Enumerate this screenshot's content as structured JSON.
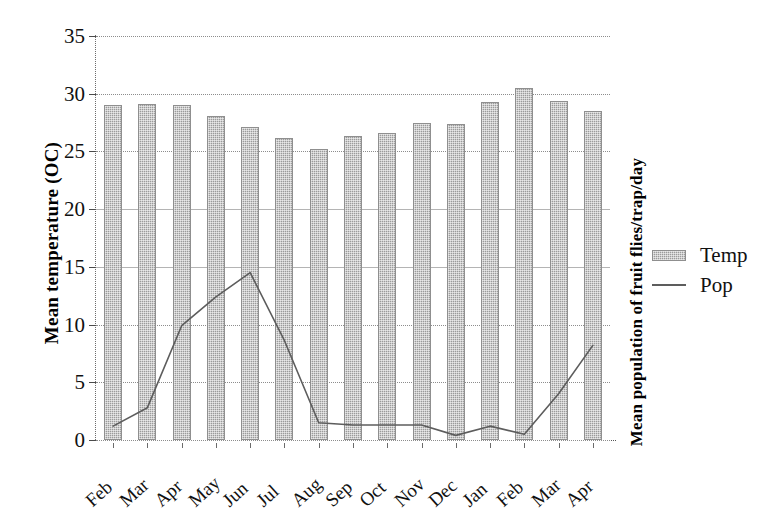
{
  "chart_data": {
    "type": "bar",
    "title": "",
    "xlabel": "",
    "ylabel": "Mean temperature (OC)",
    "y2label": "Mean population of fruit flies/trap/day",
    "ylim": [
      0,
      35
    ],
    "yticks": [
      0,
      5,
      10,
      15,
      20,
      25,
      30,
      35
    ],
    "grid": true,
    "legend_position": "right",
    "categories": [
      "Feb",
      "Mar",
      "Apr",
      "May",
      "Jun",
      "Jul",
      "Aug",
      "Sep",
      "Oct",
      "Nov",
      "Dec",
      "Jan",
      "Feb",
      "Mar",
      "Apr"
    ],
    "series": [
      {
        "name": "Temp",
        "type": "bar",
        "color": "#9b9b9b",
        "values": [
          29.0,
          29.1,
          29.0,
          28.1,
          27.1,
          26.2,
          25.2,
          26.3,
          26.6,
          27.5,
          27.4,
          29.3,
          30.5,
          29.4,
          28.5
        ]
      },
      {
        "name": "Pop",
        "type": "line",
        "color": "#5d5d5d",
        "values": [
          1.2,
          2.8,
          9.9,
          12.4,
          14.5,
          8.6,
          1.5,
          1.3,
          1.3,
          1.3,
          0.4,
          1.2,
          0.5,
          4.0,
          8.2
        ]
      }
    ]
  },
  "legend": {
    "items": [
      {
        "label": "Temp",
        "marker": "bar-swatch"
      },
      {
        "label": "Pop",
        "marker": "line-swatch"
      }
    ]
  }
}
